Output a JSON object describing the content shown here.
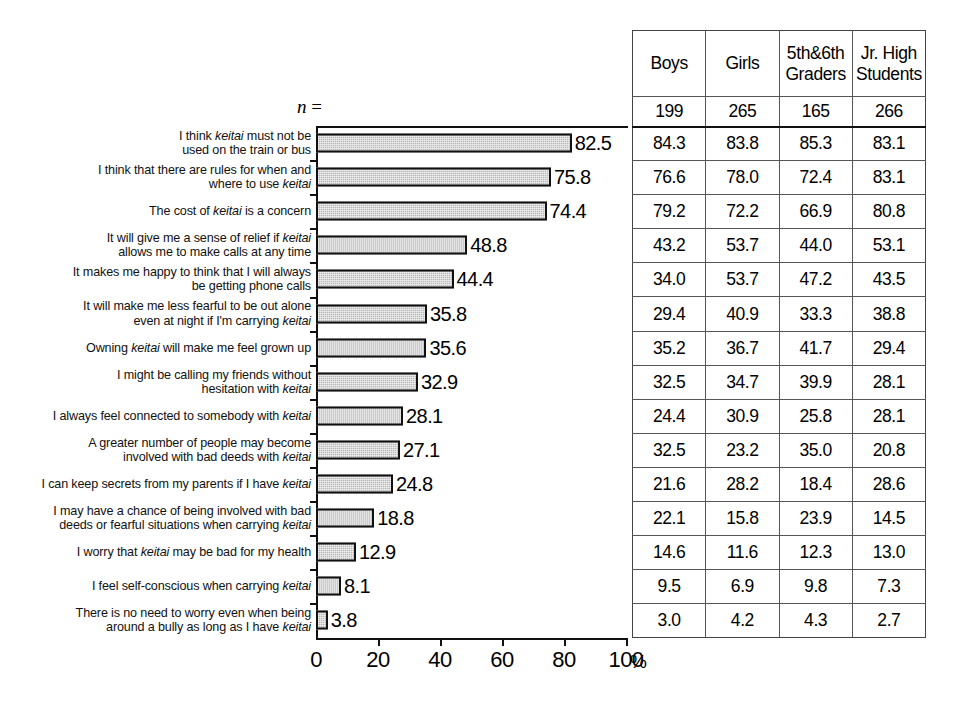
{
  "chart_data": {
    "type": "bar",
    "orientation": "horizontal",
    "title": "",
    "xlabel": "",
    "ylabel": "",
    "xlim": [
      0,
      100
    ],
    "xunit": "%",
    "xticks": [
      0,
      20,
      40,
      60,
      80,
      100
    ],
    "xtick_labels": [
      "0",
      "20",
      "40",
      "60",
      "80",
      "100"
    ],
    "grid": false,
    "legend": null,
    "categories": [
      "I think keitai must not be\nused on the train or bus",
      "I think that there are rules for when and\nwhere to use keitai",
      "The cost of keitai is a concern",
      "It will give me a sense of relief if keitai\nallows me to make calls at any time",
      "It makes me happy to think that I will always\nbe getting phone calls",
      "It will make me less fearful to be out alone\neven at night if  I'm carrying keitai",
      "Owning keitai will make me feel grown up",
      "I might be calling my friends without\nhesitation with keitai",
      "I always feel connected to somebody with keitai",
      "A greater number of people may become\ninvolved with bad deeds with keitai",
      "I can keep secrets from my parents if I have keitai",
      "I may have a chance of being involved with bad\ndeeds or fearful situations when carrying keitai",
      "I worry that keitai may be bad for my health",
      "I feel self-conscious when carrying keitai",
      "There is no need to worry even when being\naround a bully as long as I have keitai"
    ],
    "values": [
      82.5,
      75.8,
      74.4,
      48.8,
      44.4,
      35.8,
      35.6,
      32.9,
      28.1,
      27.1,
      24.8,
      18.8,
      12.9,
      8.1,
      3.8
    ],
    "value_labels": [
      "82.5",
      "75.8",
      "74.4",
      "48.8",
      "44.4",
      "35.8",
      "35.6",
      "32.9",
      "28.1",
      "27.1",
      "24.8",
      "18.8",
      "12.9",
      "8.1",
      "3.8"
    ],
    "bar_fill_color": "#b8b8b8",
    "bar_edge_color": "#111111",
    "table": {
      "n_label": "n =",
      "columns": [
        "Boys",
        "Girls",
        "5th&6th\nGraders",
        "Jr. High\nStudents"
      ],
      "n_values": [
        "199",
        "265",
        "165",
        "266"
      ],
      "rows": [
        [
          "84.3",
          "83.8",
          "85.3",
          "83.1"
        ],
        [
          "76.6",
          "78.0",
          "72.4",
          "83.1"
        ],
        [
          "79.2",
          "72.2",
          "66.9",
          "80.8"
        ],
        [
          "43.2",
          "53.7",
          "44.0",
          "53.1"
        ],
        [
          "34.0",
          "53.7",
          "47.2",
          "43.5"
        ],
        [
          "29.4",
          "40.9",
          "33.3",
          "38.8"
        ],
        [
          "35.2",
          "36.7",
          "41.7",
          "29.4"
        ],
        [
          "32.5",
          "34.7",
          "39.9",
          "28.1"
        ],
        [
          "24.4",
          "30.9",
          "25.8",
          "28.1"
        ],
        [
          "32.5",
          "23.2",
          "35.0",
          "20.8"
        ],
        [
          "21.6",
          "28.2",
          "18.4",
          "28.6"
        ],
        [
          "22.1",
          "15.8",
          "23.9",
          "14.5"
        ],
        [
          "14.6",
          "11.6",
          "12.3",
          "13.0"
        ],
        [
          "9.5",
          "6.9",
          "9.8",
          "7.3"
        ],
        [
          "3.0",
          "4.2",
          "4.3",
          "2.7"
        ]
      ]
    }
  }
}
